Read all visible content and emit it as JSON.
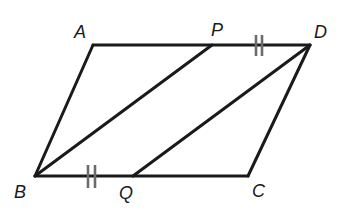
{
  "diagram": {
    "type": "geometry",
    "shape": "parallelogram",
    "name": "ABCD",
    "colors": {
      "stroke": "#1a1a1a",
      "tick": "#6b6b6b",
      "background": "#ffffff"
    },
    "vertices": {
      "A": {
        "label": "A",
        "x": 93,
        "y": 45
      },
      "B": {
        "label": "B",
        "x": 35,
        "y": 176
      },
      "C": {
        "label": "C",
        "x": 248,
        "y": 176
      },
      "D": {
        "label": "D",
        "x": 310,
        "y": 45
      },
      "P": {
        "label": "P",
        "x": 212,
        "y": 45
      },
      "Q": {
        "label": "Q",
        "x": 133,
        "y": 176
      }
    },
    "labels": {
      "A": "A",
      "B": "B",
      "C": "C",
      "D": "D",
      "P": "P",
      "Q": "Q"
    },
    "segments": [
      {
        "from": "A",
        "to": "D",
        "role": "side"
      },
      {
        "from": "D",
        "to": "C",
        "role": "side"
      },
      {
        "from": "C",
        "to": "B",
        "role": "side"
      },
      {
        "from": "B",
        "to": "A",
        "role": "side"
      },
      {
        "from": "B",
        "to": "P",
        "role": "segment"
      },
      {
        "from": "Q",
        "to": "D",
        "role": "segment"
      }
    ],
    "congruence_marks": [
      {
        "segment": "PD",
        "marks": 2
      },
      {
        "segment": "BQ",
        "marks": 2
      }
    ]
  }
}
